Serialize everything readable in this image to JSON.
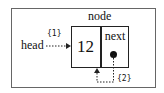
{
  "diagram": {
    "title": "node",
    "node": {
      "value": "12",
      "pointer_field": "next"
    },
    "head_label": "head",
    "annotations": [
      {
        "id": "step1",
        "label": "{1}"
      },
      {
        "id": "step2",
        "label": "{2}"
      }
    ],
    "colors": {
      "frame": "#666666",
      "stroke": "#222222",
      "background": "#ffffff"
    }
  }
}
